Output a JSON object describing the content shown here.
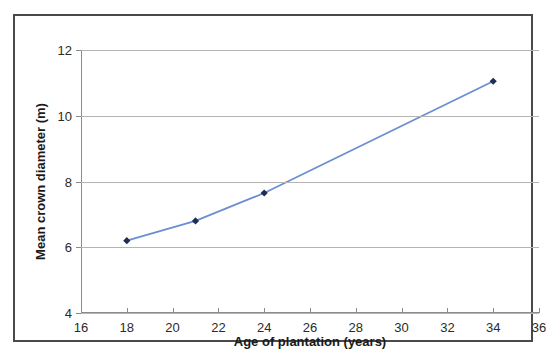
{
  "chart_data": {
    "type": "line",
    "title": "",
    "xlabel": "Age of plantation (years)",
    "ylabel": "Mean crown diameter (m)",
    "xlim": [
      16,
      36
    ],
    "ylim": [
      4,
      12
    ],
    "xticks": [
      16,
      18,
      20,
      22,
      24,
      26,
      28,
      30,
      32,
      34,
      36
    ],
    "yticks": [
      4,
      6,
      8,
      10,
      12
    ],
    "xtick_labels": [
      "16",
      "18",
      "20",
      "22",
      "24",
      "26",
      "28",
      "30",
      "32",
      "34",
      "36"
    ],
    "ytick_labels": [
      "4",
      "6",
      "8",
      "10",
      "12"
    ],
    "grid": "horizontal",
    "legend": "none",
    "series": [
      {
        "name": "Mean crown diameter",
        "line_color": "#6a8fd0",
        "marker_color": "#1f2d52",
        "marker": "diamond",
        "x": [
          18,
          21,
          24,
          34
        ],
        "y": [
          6.2,
          6.8,
          7.65,
          11.05
        ]
      }
    ]
  },
  "axes": {
    "x_title": "Age of plantation (years)",
    "y_title": "Mean crown diameter (m)"
  },
  "colors": {
    "line": "#6a8fd0",
    "marker": "#1f2d52",
    "grid": "#b4b4b4",
    "axis": "#8c8c8c",
    "frame": "#4a4a4a",
    "text": "#1a1a1a"
  }
}
